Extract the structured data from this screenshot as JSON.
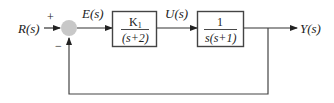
{
  "diagram": {
    "type": "feedback-control-block-diagram",
    "input": {
      "label": "R(s)"
    },
    "summing_junction": {
      "plus_sign": "+",
      "minus_sign": "−",
      "fill": "#c8c8c8"
    },
    "error_signal": {
      "label": "E(s)"
    },
    "controller_block": {
      "numerator": "K",
      "numerator_subscript": "1",
      "denominator": "(s+2)"
    },
    "control_signal": {
      "label": "U(s)"
    },
    "plant_block": {
      "numerator": "1",
      "denominator": "s(s+1)"
    },
    "output": {
      "label": "Y(s)"
    },
    "feedback": {
      "type": "unity",
      "sign": "negative"
    },
    "line_color": "#333333",
    "box_color": "#444444"
  }
}
